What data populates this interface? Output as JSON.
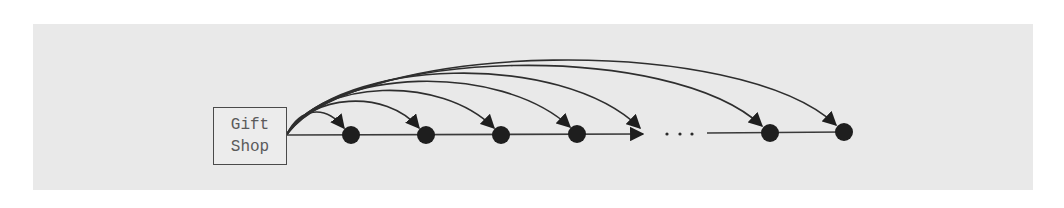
{
  "diagram": {
    "source_node": {
      "label_line1": "Gift",
      "label_line2": "Shop"
    },
    "ellipsis": "...",
    "colors": {
      "panel_background": "#e9e9e9",
      "line": "#3a3a3a",
      "node_fill": "#1e1e1e",
      "label_text": "#5a5a5a"
    },
    "nodes": [
      {
        "id": 1,
        "x": 351,
        "y": 135
      },
      {
        "id": 2,
        "x": 426,
        "y": 135
      },
      {
        "id": 3,
        "x": 501,
        "y": 135
      },
      {
        "id": 4,
        "x": 577,
        "y": 134
      },
      {
        "id": 5,
        "x": 770,
        "y": 133
      },
      {
        "id": 6,
        "x": 844,
        "y": 132
      }
    ],
    "truncated_arrow_end": {
      "x": 643,
      "y": 133
    },
    "edges_description": "Gift Shop connects via a horizontal chain to successive nodes, and via curved arrows directly to each node (and to an elided position before the ellipsis)"
  }
}
